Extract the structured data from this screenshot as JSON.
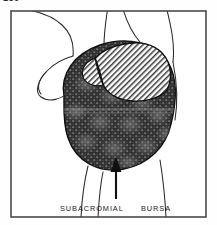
{
  "page": {
    "page_number": "150",
    "background_color": "#fefefe"
  },
  "figure": {
    "frame": {
      "border_color": "#4a4a4a",
      "fill_color": "#ffffff"
    },
    "caption": {
      "left_label": "SUBACROMIAL",
      "right_label": "BURSA"
    },
    "regions": [
      {
        "name": "subacromial-bursa-dark",
        "label": "subacromial bursa (stippled dark region)",
        "fill_style": "dark-stipple",
        "fill_color": "#3d3d3d",
        "outline_color": "#111111"
      },
      {
        "name": "acromion-hatched",
        "label": "acromion / overlying structure (diagonal hatch)",
        "fill_style": "diagonal-hatch",
        "fill_color": "#d0d0d0",
        "outline_color": "#111111"
      }
    ],
    "pointer": {
      "name": "bursa-arrow",
      "label": "arrow indicating subacromial bursa",
      "direction": "up",
      "color": "#111111"
    },
    "contours": {
      "name": "shoulder-outline",
      "label": "shoulder anatomical outline contours",
      "stroke_color": "#2a2a2a"
    }
  }
}
